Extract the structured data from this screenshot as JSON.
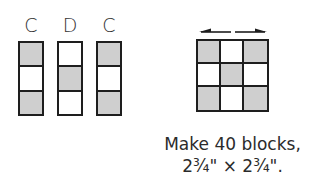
{
  "strips": [
    {
      "label": "C",
      "cells": [
        "shaded",
        "plain",
        "shaded"
      ],
      "left": 18
    },
    {
      "label": "D",
      "cells": [
        "plain",
        "shaded",
        "plain"
      ],
      "left": 57
    },
    {
      "label": "C",
      "cells": [
        "shaded",
        "plain",
        "shaded"
      ],
      "left": 96
    }
  ],
  "block": {
    "cells": [
      "shaded",
      "plain",
      "shaded",
      "plain",
      "shaded",
      "plain",
      "shaded",
      "plain",
      "shaded"
    ],
    "arrows": [
      "left-arrow",
      "right-arrow"
    ]
  },
  "caption": {
    "line1": "Make 40 blocks,",
    "line2": "2¾\" × 2¾\"."
  },
  "colors": {
    "shaded": "#cfcfcf",
    "line": "#1e1e1e",
    "background": "#ffffff"
  }
}
